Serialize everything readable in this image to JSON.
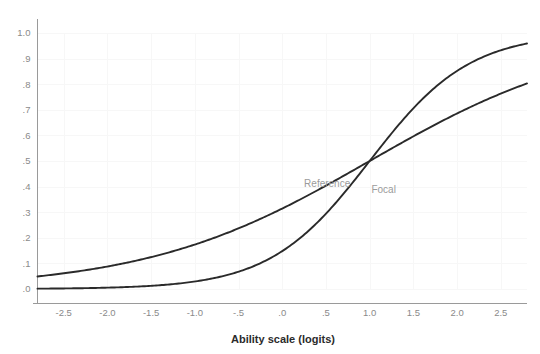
{
  "chart_data": {
    "type": "line",
    "title": "",
    "subtitle": "",
    "xlabel": "Ability scale (logits)",
    "ylabel": "",
    "xlim": [
      -2.8,
      2.8
    ],
    "ylim": [
      0.0,
      1.0
    ],
    "grid": true,
    "legend_position": "inline-annotation",
    "xticks": [
      -2.5,
      -2.0,
      -1.5,
      -1.0,
      -0.5,
      0.0,
      0.5,
      1.0,
      1.5,
      2.0,
      2.5
    ],
    "xticklabels": [
      "-2.5",
      "-2.0",
      "-1.5",
      "-1.0",
      "-.5",
      ".0",
      ".5",
      "1.0",
      "1.5",
      "2.0",
      "2.5"
    ],
    "yticks": [
      0.0,
      0.1,
      0.2,
      0.3,
      0.4,
      0.5,
      0.6,
      0.7,
      0.8,
      0.9,
      1.0
    ],
    "yticklabels": [
      ".0",
      ".1",
      ".2",
      ".3",
      ".4",
      ".5",
      ".6",
      ".7",
      ".8",
      ".9",
      "1.0"
    ],
    "annotations": [
      {
        "text": "Reference",
        "x": 0.25,
        "y": 0.4
      },
      {
        "text": "Focal",
        "x": 1.02,
        "y": 0.375
      }
    ],
    "series": [
      {
        "name": "Reference",
        "model": "2PL logistic",
        "discrimination_a": 0.78,
        "difficulty_b": 1.0,
        "color": "#2a2a2a",
        "x": [
          -2.8,
          -2.6,
          -2.4,
          -2.2,
          -2.0,
          -1.8,
          -1.6,
          -1.4,
          -1.2,
          -1.0,
          -0.8,
          -0.6,
          -0.4,
          -0.2,
          0.0,
          0.2,
          0.4,
          0.6,
          0.8,
          1.0,
          1.2,
          1.4,
          1.6,
          1.8,
          2.0,
          2.2,
          2.4,
          2.6,
          2.8
        ],
        "y": [
          0.031,
          0.036,
          0.042,
          0.049,
          0.057,
          0.066,
          0.077,
          0.089,
          0.103,
          0.119,
          0.137,
          0.158,
          0.181,
          0.207,
          0.236,
          0.268,
          0.303,
          0.34,
          0.38,
          0.421,
          0.464,
          0.507,
          0.55,
          0.592,
          0.632,
          0.67,
          0.706,
          0.739,
          0.769
        ]
      },
      {
        "name": "Focal",
        "model": "2PL logistic",
        "discrimination_a": 1.75,
        "difficulty_b": 1.0,
        "color": "#2a2a2a",
        "x": [
          -2.8,
          -2.6,
          -2.4,
          -2.2,
          -2.0,
          -1.8,
          -1.6,
          -1.4,
          -1.2,
          -1.0,
          -0.8,
          -0.6,
          -0.4,
          -0.2,
          0.0,
          0.2,
          0.4,
          0.6,
          0.8,
          1.0,
          1.2,
          1.4,
          1.6,
          1.8,
          2.0,
          2.2,
          2.4,
          2.6,
          2.8
        ],
        "y": [
          0.011,
          0.014,
          0.018,
          0.022,
          0.028,
          0.035,
          0.044,
          0.055,
          0.069,
          0.086,
          0.107,
          0.132,
          0.162,
          0.198,
          0.24,
          0.288,
          0.342,
          0.401,
          0.463,
          0.525,
          0.586,
          0.644,
          0.697,
          0.745,
          0.787,
          0.823,
          0.854,
          0.88,
          0.902
        ]
      }
    ]
  },
  "axis": {
    "x_title": "Ability scale (logits)"
  }
}
